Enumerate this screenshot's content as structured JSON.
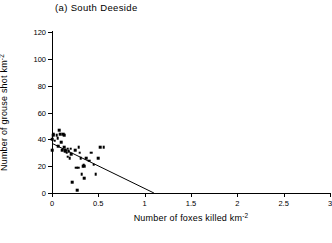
{
  "panel": {
    "title": "(a) South Deeside"
  },
  "chart_data": {
    "type": "scatter",
    "title": "(a) South Deeside",
    "xlabel": "Number of foxes killed km",
    "xlabel_sup": "-2",
    "ylabel": "Number of grouse shot km",
    "ylabel_sup": "-2",
    "xlim": [
      0,
      3
    ],
    "ylim": [
      0,
      120
    ],
    "xticks": [
      0,
      0.5,
      1,
      1.5,
      2,
      2.5,
      3
    ],
    "xticklabels": [
      "0",
      "0.5",
      "1",
      "1.5",
      "2",
      "2.5",
      "3"
    ],
    "yticks": [
      0,
      20,
      40,
      60,
      80,
      100,
      120
    ],
    "yticklabels": [
      "0",
      "20",
      "40",
      "60",
      "80",
      "100",
      "120"
    ],
    "grid": false,
    "legend": null,
    "marker": "square",
    "marker_color": "#000000",
    "points": [
      [
        0.0,
        32
      ],
      [
        0.0,
        40
      ],
      [
        0.01,
        43
      ],
      [
        0.02,
        44
      ],
      [
        0.03,
        39
      ],
      [
        0.05,
        43
      ],
      [
        0.06,
        41
      ],
      [
        0.07,
        35
      ],
      [
        0.08,
        47
      ],
      [
        0.09,
        44
      ],
      [
        0.1,
        38
      ],
      [
        0.11,
        32
      ],
      [
        0.12,
        44
      ],
      [
        0.13,
        43
      ],
      [
        0.13,
        34
      ],
      [
        0.14,
        31
      ],
      [
        0.15,
        32
      ],
      [
        0.16,
        30
      ],
      [
        0.17,
        33
      ],
      [
        0.17,
        27
      ],
      [
        0.18,
        31
      ],
      [
        0.19,
        26
      ],
      [
        0.2,
        33
      ],
      [
        0.21,
        29
      ],
      [
        0.22,
        8
      ],
      [
        0.25,
        32
      ],
      [
        0.26,
        19
      ],
      [
        0.27,
        2
      ],
      [
        0.28,
        19
      ],
      [
        0.29,
        34
      ],
      [
        0.3,
        30
      ],
      [
        0.31,
        26
      ],
      [
        0.32,
        14
      ],
      [
        0.33,
        20
      ],
      [
        0.34,
        21
      ],
      [
        0.35,
        20
      ],
      [
        0.35,
        11
      ],
      [
        0.37,
        26
      ],
      [
        0.4,
        24
      ],
      [
        0.42,
        30
      ],
      [
        0.45,
        21
      ],
      [
        0.47,
        14
      ],
      [
        0.5,
        26
      ],
      [
        0.52,
        34
      ],
      [
        0.56,
        34
      ]
    ],
    "fit_line": {
      "type": "linear-regression",
      "x": [
        0.0,
        1.1
      ],
      "y": [
        37,
        0
      ],
      "color": "#000000"
    }
  }
}
